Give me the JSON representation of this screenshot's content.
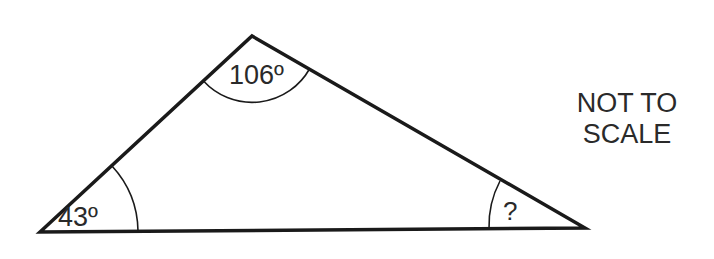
{
  "diagram": {
    "shape": "triangle",
    "vertices": {
      "left": {
        "x": 40,
        "y": 232
      },
      "top": {
        "x": 252,
        "y": 36
      },
      "right": {
        "x": 585,
        "y": 228
      }
    },
    "angles": {
      "top": "106º",
      "left": "43º",
      "right": "?"
    },
    "note": {
      "line1": "NOT TO",
      "line2": "SCALE"
    },
    "colors": {
      "stroke": "#1a1a1a",
      "text": "#2a2a2a",
      "background": "#ffffff"
    }
  }
}
